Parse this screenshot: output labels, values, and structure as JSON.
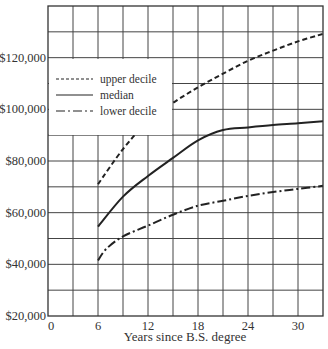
{
  "chart_data": {
    "type": "line",
    "title": "",
    "xlabel": "Years since B.S. degree",
    "ylabel": "",
    "xlim": [
      0,
      33
    ],
    "ylim": [
      20000,
      140000
    ],
    "grid": true,
    "x_ticks": [
      0,
      6,
      12,
      18,
      24,
      30
    ],
    "x_tick_labels": [
      "0",
      "6",
      "12",
      "18",
      "24",
      "30"
    ],
    "y_ticks": [
      20000,
      40000,
      60000,
      80000,
      100000,
      120000
    ],
    "y_tick_labels": [
      "$20,000",
      "$40,000",
      "$60,000",
      "$80,000",
      "$100,000",
      "$120,000"
    ],
    "legend_position": "upper left",
    "series": [
      {
        "name": "upper decile",
        "style": "dashed",
        "x": [
          6,
          9,
          12,
          15,
          18,
          21,
          24,
          27,
          30,
          33
        ],
        "values": [
          71000,
          84600,
          95400,
          102500,
          108500,
          113800,
          118800,
          122700,
          126300,
          129200
        ]
      },
      {
        "name": "median",
        "style": "solid",
        "x": [
          6,
          9,
          12,
          15,
          18,
          21,
          24,
          27,
          30,
          33
        ],
        "values": [
          54600,
          66200,
          74200,
          81200,
          88000,
          92000,
          93000,
          93900,
          94600,
          95400
        ]
      },
      {
        "name": "lower decile",
        "style": "dash-dot",
        "x": [
          6,
          7,
          9,
          12,
          15,
          18,
          21,
          24,
          27,
          30,
          33
        ],
        "values": [
          41500,
          46000,
          50800,
          55000,
          59200,
          62700,
          64600,
          66500,
          68000,
          69200,
          70400
        ]
      }
    ]
  }
}
